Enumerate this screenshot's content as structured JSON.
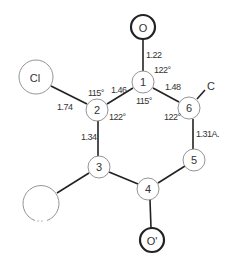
{
  "diagram": {
    "type": "molecular-structure",
    "atoms": [
      {
        "id": "O",
        "label": "O",
        "x": 143,
        "y": 27,
        "r": 12,
        "bold": true
      },
      {
        "id": "1",
        "label": "1",
        "x": 143,
        "y": 82,
        "r": 11,
        "bold": false
      },
      {
        "id": "2",
        "label": "2",
        "x": 97,
        "y": 110,
        "r": 11,
        "bold": false
      },
      {
        "id": "Cl",
        "label": "Cl",
        "x": 36,
        "y": 77,
        "r": 17,
        "bold": false
      },
      {
        "id": "6",
        "label": "6",
        "x": 189,
        "y": 108,
        "r": 11,
        "bold": false
      },
      {
        "id": "C",
        "label": "C",
        "x": 210,
        "y": 85,
        "r": 0,
        "bold": false
      },
      {
        "id": "5",
        "label": "5",
        "x": 194,
        "y": 160,
        "r": 11,
        "bold": false
      },
      {
        "id": "3",
        "label": "3",
        "x": 99,
        "y": 167,
        "r": 11,
        "bold": false
      },
      {
        "id": "4",
        "label": "4",
        "x": 148,
        "y": 189,
        "r": 11,
        "bold": false
      },
      {
        "id": "Op",
        "label": "O'",
        "x": 152,
        "y": 240,
        "r": 12,
        "bold": true
      },
      {
        "id": "X",
        "label": "",
        "x": 41,
        "y": 203,
        "r": 18,
        "bold": false
      }
    ],
    "bonds": [
      {
        "from": "O",
        "to": "1"
      },
      {
        "from": "1",
        "to": "2"
      },
      {
        "from": "1",
        "to": "6"
      },
      {
        "from": "2",
        "to": "Cl"
      },
      {
        "from": "2",
        "to": "3"
      },
      {
        "from": "6",
        "to": "5"
      },
      {
        "from": "6",
        "to": "C"
      },
      {
        "from": "3",
        "to": "4"
      },
      {
        "from": "3",
        "to": "X"
      },
      {
        "from": "4",
        "to": "5"
      },
      {
        "from": "4",
        "to": "Op"
      }
    ],
    "bond_lengths": {
      "o_1": "1.22",
      "c1_c2": "1.46",
      "c1_c6": "1.48",
      "c2_cl": "1.74",
      "c2_c3": "1.34",
      "c6_c5": "1.31A."
    },
    "angles": {
      "o_1_c6": "122°",
      "c2_1_c6": "115°",
      "cl_2_c1": "115°",
      "c1_2_c3": "122°",
      "c1_6_c5": "122°"
    }
  }
}
